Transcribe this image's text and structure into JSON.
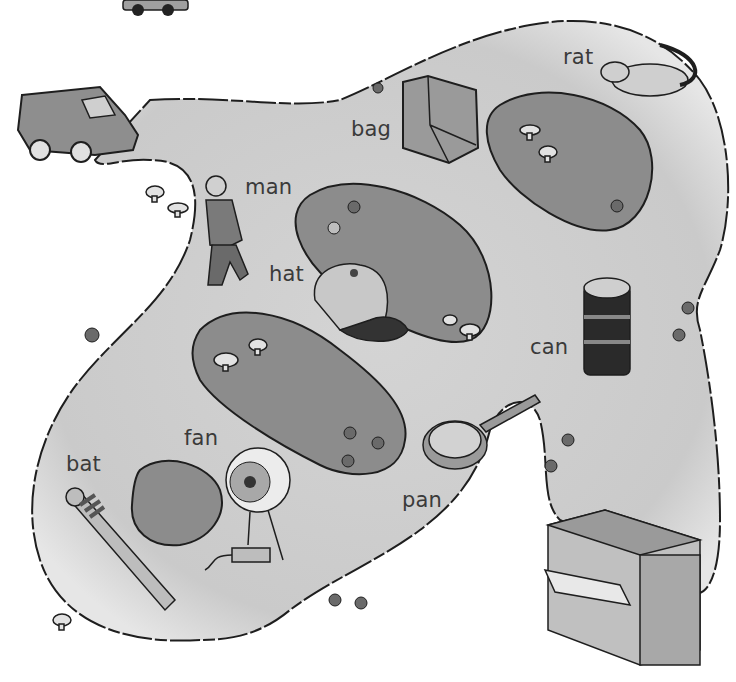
{
  "scene": {
    "type": "vocabulary picture map",
    "colors": {
      "background": "#ffffff",
      "path": "#cfcfcf",
      "grass": "#8c8c8c",
      "outline": "#1e1e1e",
      "label": "#3a3a3a"
    }
  },
  "labels": {
    "rat": "rat",
    "bag": "bag",
    "man": "man",
    "hat": "hat",
    "can": "can",
    "fan": "fan",
    "bat": "bat",
    "pan": "pan"
  },
  "objects": [
    {
      "name": "car",
      "label": null
    },
    {
      "name": "van",
      "label": null
    },
    {
      "name": "bag",
      "label": "bag"
    },
    {
      "name": "rat",
      "label": "rat"
    },
    {
      "name": "man",
      "label": "man"
    },
    {
      "name": "hat",
      "label": "hat"
    },
    {
      "name": "can",
      "label": "can"
    },
    {
      "name": "fan",
      "label": "fan"
    },
    {
      "name": "bat",
      "label": "bat"
    },
    {
      "name": "pan",
      "label": "pan"
    },
    {
      "name": "shop",
      "label": null
    }
  ]
}
